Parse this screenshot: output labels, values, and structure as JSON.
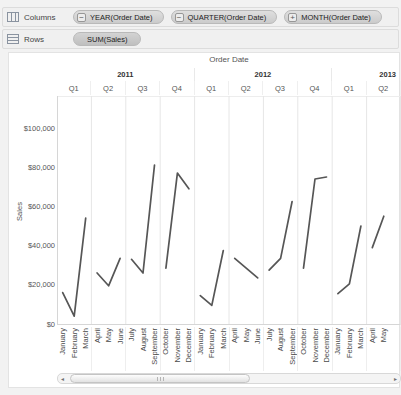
{
  "shelves": {
    "columns": {
      "label": "Columns",
      "pills": [
        {
          "label": "YEAR(Order Date)",
          "toggle": "−"
        },
        {
          "label": "QUARTER(Order Date)",
          "toggle": "−"
        },
        {
          "label": "MONTH(Order Date)",
          "toggle": "+"
        }
      ]
    },
    "rows": {
      "label": "Rows",
      "pills": [
        {
          "label": "SUM(Sales)"
        }
      ]
    }
  },
  "chart_data": {
    "type": "line",
    "header": "Order Date",
    "ylabel": "Sales",
    "ylim": [
      0,
      116000
    ],
    "grid": "vertical-pane-borders-only",
    "legend": "none",
    "line_color": "#565656",
    "y_ticks": [
      {
        "value": 0,
        "label": "$0"
      },
      {
        "value": 20000,
        "label": "$20,000"
      },
      {
        "value": 40000,
        "label": "$40,000"
      },
      {
        "value": 60000,
        "label": "$60,000"
      },
      {
        "value": 80000,
        "label": "$80,000"
      },
      {
        "value": 100000,
        "label": "$100,000"
      }
    ],
    "panes": [
      {
        "year": "2011",
        "quarter": "Q1",
        "months": [
          "January",
          "February",
          "March"
        ],
        "values": [
          16000,
          4000,
          54000
        ]
      },
      {
        "year": "2011",
        "quarter": "Q2",
        "months": [
          "April",
          "May",
          "June"
        ],
        "values": [
          26000,
          19500,
          33500
        ]
      },
      {
        "year": "2011",
        "quarter": "Q3",
        "months": [
          "July",
          "August",
          "September"
        ],
        "values": [
          33000,
          26000,
          81000
        ]
      },
      {
        "year": "2011",
        "quarter": "Q4",
        "months": [
          "October",
          "November",
          "December"
        ],
        "values": [
          28500,
          77000,
          69000
        ]
      },
      {
        "year": "2012",
        "quarter": "Q1",
        "months": [
          "January",
          "February",
          "March"
        ],
        "values": [
          14500,
          9500,
          37500
        ]
      },
      {
        "year": "2012",
        "quarter": "Q2",
        "months": [
          "April",
          "May",
          "June"
        ],
        "values": [
          33500,
          28500,
          23500
        ]
      },
      {
        "year": "2012",
        "quarter": "Q3",
        "months": [
          "July",
          "August",
          "September"
        ],
        "values": [
          27500,
          33500,
          62500
        ]
      },
      {
        "year": "2012",
        "quarter": "Q4",
        "months": [
          "October",
          "November",
          "December"
        ],
        "values": [
          28500,
          74000,
          75000
        ]
      },
      {
        "year": "2013",
        "quarter": "Q1",
        "months": [
          "January",
          "February",
          "March"
        ],
        "values": [
          15500,
          20500,
          50000
        ]
      },
      {
        "year": "2013",
        "quarter": "Q2",
        "months": [
          "April",
          "May"
        ],
        "values": [
          39000,
          55000
        ]
      }
    ]
  },
  "scrollbar": {
    "left_arrow": "◂",
    "right_arrow": "▸"
  }
}
